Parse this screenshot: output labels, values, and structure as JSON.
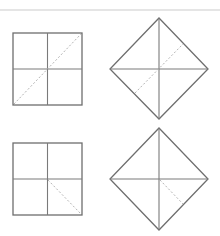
{
  "diagram": {
    "colors": {
      "background": "#ffffff",
      "outline": "#6e6e6e",
      "fold_line": "#7a7a7a",
      "dashed_line": "#b4b4b4",
      "top_rule": "#dcdcdc"
    },
    "figures": [
      {
        "id": "square-1",
        "shape": "square",
        "dashed": "full diagonal bottom-left to top-right"
      },
      {
        "id": "diamond-1",
        "shape": "diamond",
        "dashed": "lower-left edge midpoint to upper-right edge midpoint"
      },
      {
        "id": "square-2",
        "shape": "square",
        "dashed": "center to bottom-right corner"
      },
      {
        "id": "diamond-2",
        "shape": "diamond",
        "dashed": "center to lower-right edge midpoint"
      }
    ]
  }
}
